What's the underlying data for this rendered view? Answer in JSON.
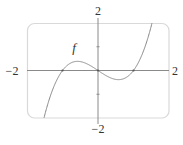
{
  "chart_data": {
    "type": "line",
    "title": "",
    "xlabel": "",
    "ylabel": "",
    "xlim": [
      -2,
      2
    ],
    "ylim": [
      -2,
      2
    ],
    "grid": false,
    "legend": null,
    "x_tick_labels": [
      {
        "value": -2,
        "label": "−2"
      },
      {
        "value": 2,
        "label": "2"
      }
    ],
    "y_tick_labels": [
      {
        "value": 2,
        "label": "2"
      },
      {
        "value": -2,
        "label": "−2"
      }
    ],
    "y_minor_ticks": [
      -1,
      1
    ],
    "series": [
      {
        "name": "f",
        "expression": "x^3 - x",
        "x": [
          -1.6,
          -1.5,
          -1.25,
          -1.0,
          -0.75,
          -0.577,
          -0.5,
          -0.25,
          0.0,
          0.25,
          0.5,
          0.577,
          0.75,
          1.0,
          1.25,
          1.5,
          1.55
        ],
        "y": [
          -2.5,
          -1.875,
          -0.703,
          0.0,
          0.328,
          0.385,
          0.375,
          0.234,
          0.0,
          -0.234,
          -0.375,
          -0.385,
          -0.328,
          0.0,
          0.703,
          1.875,
          2.174
        ],
        "color": "#888888"
      }
    ],
    "annotations": [
      {
        "text": "f",
        "x": -0.65,
        "y": 0.9
      }
    ],
    "marked_points": [
      {
        "x": -1,
        "y": 0
      },
      {
        "x": 0,
        "y": 0
      },
      {
        "x": 1,
        "y": 0
      }
    ]
  },
  "labels": {
    "x_min": "−2",
    "x_max": "2",
    "y_max": "2",
    "y_min": "−2",
    "curve": "f"
  },
  "colors": {
    "frame": "#d9d9d9",
    "axis": "#8a8a8a",
    "curve": "#8c8c8c",
    "text": "#333333"
  }
}
